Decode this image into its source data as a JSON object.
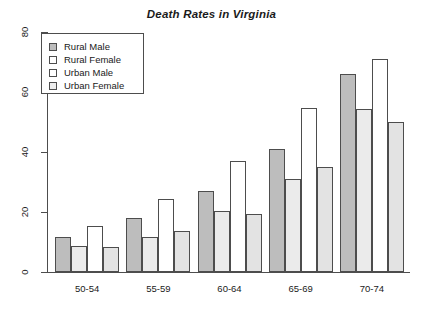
{
  "chart_data": {
    "type": "bar",
    "title": "Death Rates in Virginia",
    "xlabel": "",
    "ylabel": "",
    "categories": [
      "50-54",
      "55-59",
      "60-64",
      "65-69",
      "70-74"
    ],
    "series": [
      {
        "name": "Rural Male",
        "color": "#bdbdbd",
        "values": [
          11.7,
          18.1,
          26.9,
          41.0,
          66.0
        ]
      },
      {
        "name": "Rural Female",
        "color": "#ebebeb",
        "values": [
          8.7,
          11.7,
          20.3,
          30.9,
          54.3
        ]
      },
      {
        "name": "Urban Male",
        "color": "#ffffff",
        "values": [
          15.4,
          24.3,
          37.0,
          54.6,
          71.1
        ]
      },
      {
        "name": "Urban Female",
        "color": "#e3e3e3",
        "values": [
          8.4,
          13.6,
          19.3,
          35.1,
          50.0
        ]
      }
    ],
    "ylim": [
      0,
      80
    ],
    "yticks": [
      0,
      20,
      40,
      60,
      80
    ],
    "ytick_labels": [
      "0",
      "20",
      "40",
      "60",
      "80"
    ],
    "grid": false,
    "legend_position": "top-left",
    "bar_mode": "grouped"
  },
  "legend": {
    "entries": [
      {
        "label": "Rural Male"
      },
      {
        "label": "Rural Female"
      },
      {
        "label": "Urban Male"
      },
      {
        "label": "Urban Female"
      }
    ]
  },
  "axes": {
    "y_ticks": [
      {
        "label": "0",
        "value": 0
      },
      {
        "label": "20",
        "value": 20
      },
      {
        "label": "40",
        "value": 40
      },
      {
        "label": "60",
        "value": 60
      },
      {
        "label": "80",
        "value": 80
      }
    ],
    "x_groups": [
      {
        "label": "50-54"
      },
      {
        "label": "55-59"
      },
      {
        "label": "60-64"
      },
      {
        "label": "65-69"
      },
      {
        "label": "70-74"
      }
    ]
  }
}
